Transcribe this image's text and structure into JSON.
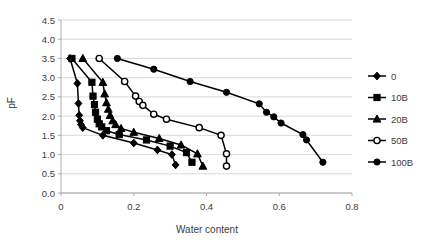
{
  "chart_data": {
    "type": "line",
    "title": "",
    "xlabel": "Water content",
    "ylabel": "pF",
    "xlim": [
      0,
      0.8
    ],
    "ylim": [
      0,
      4.5
    ],
    "xticks": [
      "0",
      "0.2",
      "0.4",
      "0.6",
      "0.8"
    ],
    "xtick_values": [
      0,
      0.2,
      0.4,
      0.6,
      0.8
    ],
    "yticks": [
      "0.0",
      "0.5",
      "1.0",
      "1.5",
      "2.0",
      "2.5",
      "3.0",
      "3.5",
      "4.0",
      "4.5"
    ],
    "ytick_values": [
      0,
      0.5,
      1.0,
      1.5,
      2.0,
      2.5,
      3.0,
      3.5,
      4.0,
      4.5
    ],
    "grid": "horizontal",
    "legend_position": "right",
    "series": [
      {
        "name": "0",
        "marker": "diamond",
        "fill": "solid",
        "x": [
          0.025,
          0.045,
          0.048,
          0.05,
          0.052,
          0.055,
          0.06,
          0.115,
          0.2,
          0.265,
          0.305,
          0.315
        ],
        "y": [
          3.5,
          2.85,
          2.33,
          2.02,
          1.88,
          1.78,
          1.7,
          1.5,
          1.3,
          1.12,
          1.0,
          0.73
        ]
      },
      {
        "name": "10B",
        "marker": "square",
        "fill": "solid",
        "x": [
          0.03,
          0.085,
          0.088,
          0.092,
          0.095,
          0.1,
          0.105,
          0.112,
          0.125,
          0.16,
          0.235,
          0.3,
          0.345,
          0.36
        ],
        "y": [
          3.5,
          2.88,
          2.52,
          2.3,
          2.1,
          1.92,
          1.8,
          1.72,
          1.62,
          1.52,
          1.38,
          1.22,
          1.05,
          0.8
        ]
      },
      {
        "name": "20B",
        "marker": "triangle",
        "fill": "solid",
        "x": [
          0.06,
          0.115,
          0.12,
          0.125,
          0.13,
          0.135,
          0.142,
          0.15,
          0.165,
          0.2,
          0.27,
          0.33,
          0.375,
          0.39
        ],
        "y": [
          3.5,
          2.88,
          2.58,
          2.35,
          2.18,
          2.02,
          1.88,
          1.78,
          1.68,
          1.58,
          1.42,
          1.25,
          1.02,
          0.7
        ]
      },
      {
        "name": "50B",
        "marker": "circle",
        "fill": "open",
        "x": [
          0.105,
          0.175,
          0.205,
          0.215,
          0.225,
          0.255,
          0.29,
          0.38,
          0.44,
          0.455,
          0.455
        ],
        "y": [
          3.5,
          2.9,
          2.52,
          2.38,
          2.28,
          2.05,
          1.92,
          1.7,
          1.5,
          1.02,
          0.7
        ]
      },
      {
        "name": "100B",
        "marker": "circle",
        "fill": "solid",
        "x": [
          0.155,
          0.255,
          0.355,
          0.455,
          0.545,
          0.565,
          0.585,
          0.605,
          0.665,
          0.675,
          0.72
        ],
        "y": [
          3.5,
          3.22,
          2.9,
          2.62,
          2.32,
          2.1,
          1.98,
          1.82,
          1.52,
          1.38,
          0.8
        ]
      }
    ]
  },
  "legend": {
    "items": [
      {
        "label": "0"
      },
      {
        "label": "10B"
      },
      {
        "label": "20B"
      },
      {
        "label": "50B"
      },
      {
        "label": "100B"
      }
    ]
  }
}
